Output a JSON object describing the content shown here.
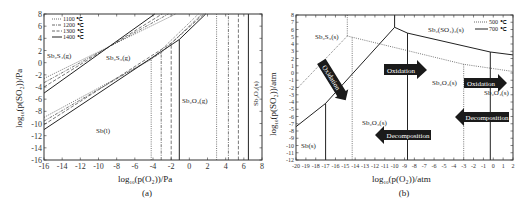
{
  "chart_data": [
    {
      "id": "a",
      "type": "line",
      "title": "",
      "subtitle": "(a)",
      "xlabel": "log10(p(O2))/Pa",
      "ylabel": "log10(p(SO2))/Pa",
      "xlim": [
        -16,
        8
      ],
      "ylim": [
        -16,
        8
      ],
      "xticks": [
        -16,
        -14,
        -12,
        -10,
        -8,
        -6,
        -4,
        -2,
        0,
        2,
        4,
        6,
        8
      ],
      "yticks": [
        8,
        6,
        4,
        2,
        0,
        -2,
        -4,
        -6,
        -8,
        -10,
        -12,
        -14,
        -16
      ],
      "grid": false,
      "legend": {
        "position": "upper-left",
        "entries": [
          {
            "label": "1100 ℃",
            "style": "dotted"
          },
          {
            "label": "1200 ℃",
            "style": "dashdot"
          },
          {
            "label": "1300 ℃",
            "style": "dashed"
          },
          {
            "label": "1400 ℃",
            "style": "solid"
          }
        ]
      },
      "series": [
        {
          "name": "1100 ℃",
          "style": "dotted",
          "upper_boundary": [
            [
              -16,
              -2.6
            ],
            [
              -1.5,
              8
            ]
          ],
          "lower_boundary": [
            [
              -16,
              -9.0
            ],
            [
              -4.2,
              0.5
            ],
            [
              1.0,
              8
            ]
          ],
          "vertical_lines_x": [
            -4.2,
            3.0
          ]
        },
        {
          "name": "1200 ℃",
          "style": "dashdot",
          "upper_boundary": [
            [
              -16,
              -3.3
            ],
            [
              -2.3,
              8
            ]
          ],
          "lower_boundary": [
            [
              -16,
              -9.6
            ],
            [
              -3.1,
              1.6
            ],
            [
              1.4,
              8
            ]
          ],
          "vertical_lines_x": [
            -3.1,
            4.3
          ]
        },
        {
          "name": "1300 ℃",
          "style": "dashed",
          "upper_boundary": [
            [
              -16,
              -4.0
            ],
            [
              -3.0,
              8
            ]
          ],
          "lower_boundary": [
            [
              -16,
              -10.2
            ],
            [
              -2.0,
              3.2
            ],
            [
              1.6,
              8
            ]
          ],
          "vertical_lines_x": [
            -2.0,
            5.4
          ]
        },
        {
          "name": "1400 ℃",
          "style": "solid",
          "upper_boundary": [
            [
              -16,
              -5.0
            ],
            [
              -3.8,
              8
            ]
          ],
          "lower_boundary": [
            [
              -16,
              -11.0
            ],
            [
              -1.1,
              3.8
            ],
            [
              1.8,
              8
            ]
          ],
          "vertical_lines_x": [
            -1.1,
            6.5
          ]
        }
      ],
      "annotations": [
        {
          "text": "Sb2S4(g)",
          "x": -15.5,
          "y": 2.2
        },
        {
          "text": "Sb2S3(g)",
          "x": -9.0,
          "y": 1.8
        },
        {
          "text": "Sb(l)",
          "x": -10.5,
          "y": -11.0
        },
        {
          "text": "Sb2O3(g)",
          "x": 1.5,
          "y": -7.0
        },
        {
          "text": "Sb2O4(s)",
          "x": 7.3,
          "y": -4.5,
          "rotated": true
        }
      ]
    },
    {
      "id": "b",
      "type": "line",
      "title": "",
      "subtitle": "(b)",
      "xlabel": "log10(p(O2))/atm",
      "ylabel": "log10(p(SO2))/atm",
      "xlim": [
        -20,
        2
      ],
      "ylim": [
        -12,
        8
      ],
      "xticks": [
        -20,
        -19,
        -18,
        -17,
        -16,
        -15,
        -14,
        -13,
        -12,
        -11,
        -10,
        -9,
        -8,
        -7,
        -6,
        -5,
        -4,
        -3,
        -2,
        -1,
        0,
        1,
        2
      ],
      "yticks": [
        8,
        7,
        6,
        5,
        4,
        3,
        2,
        1,
        0,
        -1,
        -2,
        -3,
        -4,
        -5,
        -6,
        -7,
        -8,
        -9,
        -10,
        -11,
        -12
      ],
      "grid": false,
      "legend": {
        "position": "upper-right",
        "entries": [
          {
            "label": "500 ℃",
            "style": "dotted"
          },
          {
            "label": "700 ℃",
            "style": "solid"
          }
        ]
      },
      "series": [
        {
          "name": "500 ℃",
          "style": "dotted",
          "lines": [
            [
              [
                -20,
                -2.3
              ],
              [
                -14.8,
                5.1
              ]
            ],
            [
              [
                -14.8,
                5.1
              ],
              [
                -3.0,
                1.2
              ],
              [
                2,
                0.2
              ]
            ],
            [
              [
                -14.8,
                8
              ],
              [
                -14.8,
                5.1
              ]
            ],
            [
              [
                -14.3,
                4.9
              ],
              [
                -14.3,
                -12
              ]
            ],
            [
              [
                -3.0,
                1.2
              ],
              [
                -3.0,
                -12
              ]
            ]
          ]
        },
        {
          "name": "700 ℃",
          "style": "solid",
          "lines": [
            [
              [
                -20,
                -7.4
              ],
              [
                -17.0,
                -4.2
              ],
              [
                -10.0,
                6.3
              ]
            ],
            [
              [
                -17.0,
                -4.2
              ],
              [
                -17.0,
                -12
              ]
            ],
            [
              [
                -10.0,
                6.3
              ],
              [
                -10.0,
                8
              ]
            ],
            [
              [
                -10.0,
                6.3
              ],
              [
                -8.7,
                5.5
              ],
              [
                -0.3,
                2.9
              ],
              [
                2,
                2.5
              ]
            ],
            [
              [
                -8.7,
                5.5
              ],
              [
                -8.7,
                -12
              ]
            ],
            [
              [
                -0.3,
                2.9
              ],
              [
                -0.3,
                -12
              ]
            ]
          ]
        }
      ],
      "annotations": [
        {
          "text": "Sb2S3(s)",
          "x": -17.5,
          "y": 4.8
        },
        {
          "text": "Sb2(SO4)3(s)",
          "x": -4.2,
          "y": 6.2
        },
        {
          "text": "Sb2O3(s)",
          "x": -4.5,
          "y": -1.2
        },
        {
          "text": "Sb2O4(s)",
          "x": 0.2,
          "y": -2.6
        },
        {
          "text": "Sb2O3(s)",
          "x": -13.0,
          "y": -6.8
        },
        {
          "text": "Sb(s)",
          "x": -19.5,
          "y": -10.2
        }
      ],
      "arrows": [
        {
          "text": "Oxidation",
          "direction": "down-right",
          "from": [
            -15.5,
            3.3
          ],
          "to": [
            -13.5,
            -2.5
          ]
        },
        {
          "text": "Oxidation",
          "direction": "right",
          "from": [
            -10.5,
            0.5
          ],
          "to": [
            -5.8,
            0.5
          ]
        },
        {
          "text": "Oxidation",
          "direction": "right",
          "from": [
            -3.0,
            -1.5
          ],
          "to": [
            1.3,
            -1.5
          ]
        },
        {
          "text": "Decomposition",
          "direction": "left",
          "from": [
            1.0,
            -6.0
          ],
          "to": [
            -4.2,
            -6.0
          ]
        },
        {
          "text": "Decomposition",
          "direction": "left",
          "from": [
            -7.0,
            -8.5
          ],
          "to": [
            -12.5,
            -8.5
          ]
        }
      ]
    }
  ],
  "labels": {
    "a": {
      "subtitle": "(a)",
      "xlabel_main": "log",
      "xlabel_sub": "10",
      "xlabel_rest": "(p(O₂))/Pa",
      "ylabel_main": "log",
      "ylabel_sub": "10",
      "ylabel_rest": "(p(SO₂))/Pa",
      "legend": [
        "1100 ℃",
        "1200 ℃",
        "1300 ℃",
        "1400 ℃"
      ],
      "regions": {
        "sb2s4": "Sb₂S₄(g)",
        "sb2s3": "Sb₂S₃(g)",
        "sb": "Sb(l)",
        "sb2o3": "Sb₂O₃(g)",
        "sb2o4": "Sb₂O₄(s)"
      }
    },
    "b": {
      "subtitle": "(b)",
      "xlabel_main": "log",
      "xlabel_sub": "10",
      "xlabel_rest": "(p(O₂))/atm",
      "ylabel_main": "log",
      "ylabel_sub": "10",
      "ylabel_rest": "(p(SO₂))/atm",
      "legend": [
        "500 ℃",
        "700 ℃"
      ],
      "regions": {
        "sb2s3": "Sb₂S₃(s)",
        "sb2so43": "Sb₂(SO₄)₃(s)",
        "sb2o3_upper": "Sb₂O₃(s)",
        "sb2o4": "Sb₂O₄(s)",
        "sb2o3_lower": "Sb₂O₃(s)",
        "sb": "Sb(s)"
      },
      "arrows": [
        "Oxidation",
        "Oxidation",
        "Oxidation",
        "Decomposition",
        "Decomposition"
      ]
    }
  },
  "colors": {
    "line": "#333333",
    "arrow_fill": "#1a1a1a",
    "arrow_text": "#ffffff",
    "background": "#ffffff"
  }
}
